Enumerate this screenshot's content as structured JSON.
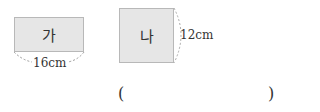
{
  "figures": {
    "ga": {
      "label": "가",
      "dimension": "16cm"
    },
    "na": {
      "label": "나",
      "dimension": "12cm"
    }
  },
  "answer": {
    "open": "(",
    "close": ")",
    "value": ""
  }
}
